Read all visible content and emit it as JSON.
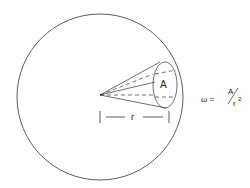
{
  "diagram": {
    "area_label": "A",
    "radius_label": "r",
    "formula": {
      "lhs": "ω =",
      "numerator": "A",
      "denominator": "r",
      "exponent": "2"
    },
    "stroke_color": "#333333"
  }
}
